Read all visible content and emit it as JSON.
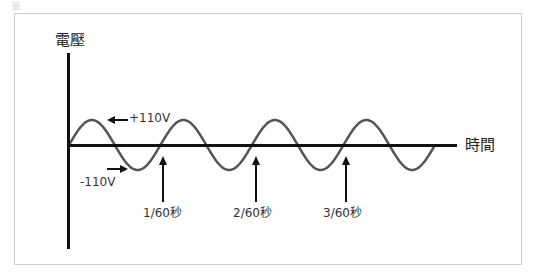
{
  "caption": "圖",
  "diagram": {
    "title": "",
    "y_axis_label": "電壓",
    "x_axis_label": "時間",
    "peak_label": "+110V",
    "trough_label": "-110V",
    "time_markers": [
      {
        "label": "1/60秒",
        "x": 162
      },
      {
        "label": "2/60秒",
        "x": 256
      },
      {
        "label": "3/60秒",
        "x": 346
      }
    ],
    "wave": {
      "type": "sine",
      "cycles": 4,
      "amplitude_label": "110V",
      "color": "#555555"
    },
    "axis_color": "#111111"
  }
}
